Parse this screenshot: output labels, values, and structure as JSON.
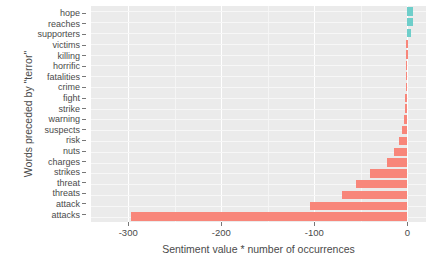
{
  "chart_data": {
    "type": "bar",
    "orientation": "horizontal",
    "title": "",
    "xlabel": "Sentiment value * number of occurrences",
    "ylabel": "Words preceded by \"terror\"",
    "xlim": [
      -340,
      20
    ],
    "xticks": [
      -300,
      -200,
      -100,
      0
    ],
    "xtick_labels": [
      "-300",
      "-200",
      "-100",
      "0"
    ],
    "grid": true,
    "legend": "none",
    "categories": [
      "hope",
      "reaches",
      "supporters",
      "victims",
      "killing",
      "horrific",
      "fatalities",
      "crime",
      "fight",
      "strike",
      "warning",
      "suspects",
      "risk",
      "nuts",
      "charges",
      "strikes",
      "threat",
      "threats",
      "attack",
      "attacks"
    ],
    "values": [
      6,
      6,
      4,
      -1,
      -1,
      -2,
      -2,
      -2,
      -3,
      -3,
      -4,
      -6,
      -9,
      -14,
      -22,
      -40,
      -55,
      -70,
      -105,
      -297
    ],
    "bar_colors": {
      "positive": "#6ececa",
      "negative": "#f8867a"
    },
    "panel_background": "#ebebeb",
    "gridline_color": "#ffffff"
  }
}
